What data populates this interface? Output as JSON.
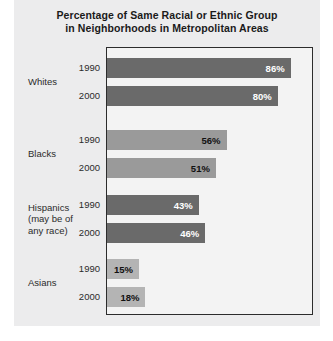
{
  "chart_data": {
    "type": "bar",
    "orientation": "horizontal",
    "title": "Percentage of Same Racial or Ethnic Group in Neighborhoods in Metropolitan Areas",
    "title_lines": [
      "Percentage of Same Racial or Ethnic Group",
      "in Neighborhoods in Metropolitan Areas"
    ],
    "xlabel": "",
    "ylabel": "",
    "xlim": [
      0,
      100
    ],
    "grid": false,
    "legend": "none",
    "categories": [
      "Whites",
      "Blacks",
      "Hispanics (may be of any race)",
      "Asians"
    ],
    "series": [
      {
        "name": "1990",
        "values": [
          86,
          56,
          43,
          15
        ]
      },
      {
        "name": "2000",
        "values": [
          80,
          51,
          46,
          18
        ]
      }
    ],
    "groups": [
      {
        "label_lines": [
          "Whites"
        ],
        "color": "#6a6a6a",
        "value_color": "#ffffff",
        "value_position": "inside",
        "bars": [
          {
            "year": "1990",
            "value": 86,
            "value_label": "86%"
          },
          {
            "year": "2000",
            "value": 80,
            "value_label": "80%"
          }
        ]
      },
      {
        "label_lines": [
          "Blacks"
        ],
        "color": "#9a9a9a",
        "value_color": "#111111",
        "value_position": "inside",
        "bars": [
          {
            "year": "1990",
            "value": 56,
            "value_label": "56%"
          },
          {
            "year": "2000",
            "value": 51,
            "value_label": "51%"
          }
        ]
      },
      {
        "label_lines": [
          "Hispanics",
          "(may be of",
          "any race)"
        ],
        "color": "#6a6a6a",
        "value_color": "#ffffff",
        "value_position": "inside",
        "bars": [
          {
            "year": "1990",
            "value": 43,
            "value_label": "43%"
          },
          {
            "year": "2000",
            "value": 46,
            "value_label": "46%"
          }
        ]
      },
      {
        "label_lines": [
          "Asians"
        ],
        "color": "#b4b4b4",
        "value_color": "#111111",
        "value_position": "inside",
        "bars": [
          {
            "year": "1990",
            "value": 15,
            "value_label": "15%"
          },
          {
            "year": "2000",
            "value": 18,
            "value_label": "18%"
          }
        ]
      }
    ]
  },
  "colors": {
    "panel_background": "#ececed",
    "plot_background": "#f3f3f3",
    "plot_border": "#2c2c2c",
    "bar_dark": "#6a6a6a",
    "bar_medium": "#9a9a9a",
    "bar_light": "#b4b4b4",
    "text": "#2b2b2b"
  }
}
